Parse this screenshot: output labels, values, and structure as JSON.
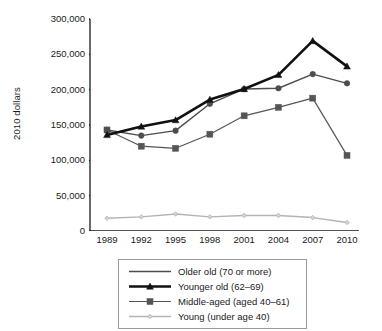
{
  "chart_data": {
    "type": "line",
    "title": "",
    "xlabel": "",
    "ylabel": "2010 dollars",
    "x": [
      1989,
      1992,
      1995,
      1998,
      2001,
      2004,
      2007,
      2010
    ],
    "xtick_labels": [
      "1989",
      "1992",
      "1995",
      "1998",
      "2001",
      "2004",
      "2007",
      "2010"
    ],
    "ytick_labels": [
      "0",
      "50,000",
      "100,000",
      "150,000",
      "200,000",
      "250,000",
      "300,000"
    ],
    "ytick_values": [
      0,
      50000,
      100000,
      150000,
      200000,
      250000,
      300000
    ],
    "ylim": [
      0,
      300000
    ],
    "grid": false,
    "legend_position": "below-center",
    "series": [
      {
        "name": "Older old (70 or more)",
        "values": [
          143000,
          135000,
          142000,
          180000,
          201000,
          202000,
          222000,
          209000
        ],
        "color": "#4d4d4d",
        "marker": "circle",
        "legend_marker": "none",
        "line_width": 1.4
      },
      {
        "name": "Younger old (62–69)",
        "values": [
          136000,
          148000,
          157000,
          186000,
          201000,
          221000,
          269000,
          233000
        ],
        "color": "#111111",
        "marker": "triangle",
        "legend_marker": "triangle",
        "line_width": 2.6
      },
      {
        "name": "Middle-aged (aged 40–61)",
        "values": [
          143000,
          120000,
          117000,
          137000,
          163000,
          175000,
          188000,
          107000
        ],
        "color": "#555555",
        "marker": "square",
        "legend_marker": "square",
        "line_width": 1.2
      },
      {
        "name": "Young (under age 40)",
        "values": [
          18000,
          20000,
          24000,
          20000,
          22000,
          22000,
          19000,
          12000
        ],
        "color": "#b3b3b3",
        "marker": "diamond",
        "legend_marker": "diamond",
        "line_width": 1.4
      }
    ]
  },
  "axis": {
    "ylabel": "2010 dollars"
  },
  "legend": {
    "items": [
      {
        "label": "Older old (70 or more)"
      },
      {
        "label": "Younger old (62–69)"
      },
      {
        "label": "Middle-aged (aged 40–61)"
      },
      {
        "label": "Young (under age 40)"
      }
    ]
  }
}
